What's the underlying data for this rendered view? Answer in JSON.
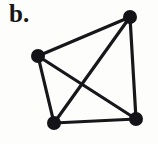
{
  "figure": {
    "panel_label": "b.",
    "caption_text": "b.",
    "background_color": "#fdfdfc",
    "ink_color": "#17161a",
    "width": 158,
    "height": 144
  },
  "graph": {
    "name": "complete-graph-k4",
    "type": "undirected-graph",
    "vertex_count": 4,
    "edge_count": 6,
    "vertex_radius": 7,
    "edge_width": 3.2,
    "vertices": [
      {
        "id": "v1",
        "label": "top-right",
        "x": 130,
        "y": 17
      },
      {
        "id": "v2",
        "label": "left",
        "x": 38,
        "y": 56
      },
      {
        "id": "v3",
        "label": "bottom-left",
        "x": 54,
        "y": 123
      },
      {
        "id": "v4",
        "label": "bottom-right",
        "x": 136,
        "y": 119
      }
    ],
    "edges": [
      {
        "id": "e1",
        "from": "v2",
        "to": "v1",
        "name": "edge-left-to-topright"
      },
      {
        "id": "e2",
        "from": "v1",
        "to": "v4",
        "name": "edge-topright-to-bottomright"
      },
      {
        "id": "e3",
        "from": "v4",
        "to": "v3",
        "name": "edge-bottomright-to-bottomleft"
      },
      {
        "id": "e4",
        "from": "v3",
        "to": "v2",
        "name": "edge-bottomleft-to-left"
      },
      {
        "id": "e5",
        "from": "v2",
        "to": "v4",
        "name": "edge-left-to-bottomright-diagonal"
      },
      {
        "id": "e6",
        "from": "v3",
        "to": "v1",
        "name": "edge-bottomleft-to-topright-diagonal"
      }
    ],
    "crossing_point": {
      "x": 83,
      "y": 85
    }
  }
}
